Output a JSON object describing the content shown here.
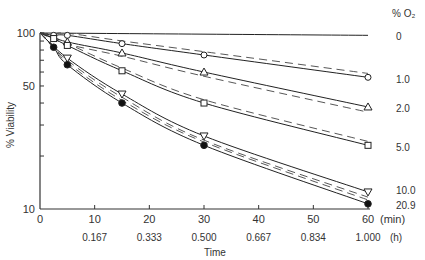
{
  "chart_data": {
    "type": "line",
    "title": "",
    "xlabel": "Time",
    "ylabel": "% Viability",
    "x_unit_primary": "(min)",
    "x_unit_secondary": "(h)",
    "xlim": [
      0,
      60
    ],
    "ylim": [
      10,
      100
    ],
    "yscale": "log",
    "x_ticks": [
      0,
      10,
      20,
      30,
      40,
      50,
      60
    ],
    "x_tick_labels": [
      "0",
      "10",
      "20",
      "30",
      "40",
      "50",
      "60"
    ],
    "x_tick_labels_hours": [
      "",
      "0.167",
      "0.333",
      "0.500",
      "0.667",
      "0.834",
      "1.000"
    ],
    "y_tick_labels": [
      {
        "value": 100,
        "label": "100"
      },
      {
        "value": 50,
        "label": "50"
      },
      {
        "value": 10,
        "label": "10"
      }
    ],
    "legend_title": "% O₂",
    "legend_position": "right",
    "grid": false,
    "series": [
      {
        "name": "0",
        "marker": "none",
        "x": [
          0,
          60
        ],
        "values": [
          100,
          97
        ],
        "fit": [
          [
            0,
            100
          ],
          [
            60,
            97
          ]
        ]
      },
      {
        "name": "1.0",
        "marker": "open-circle",
        "x": [
          2.5,
          5,
          15,
          30,
          60
        ],
        "values": [
          97,
          97,
          87,
          75,
          56
        ]
      },
      {
        "name": "2.0",
        "marker": "open-triangle",
        "x": [
          5,
          15,
          30,
          60
        ],
        "values": [
          89,
          77,
          60,
          38
        ]
      },
      {
        "name": "5.0",
        "marker": "open-square",
        "x": [
          2.5,
          5,
          15,
          30,
          60
        ],
        "values": [
          93,
          85,
          61,
          40,
          23
        ]
      },
      {
        "name": "10.0",
        "marker": "open-inverted-triangle",
        "x": [
          5,
          15,
          30,
          60
        ],
        "values": [
          72,
          45,
          26,
          12.5
        ]
      },
      {
        "name": "20.9",
        "marker": "filled-circle",
        "x": [
          2.5,
          5,
          15,
          30,
          60
        ],
        "values": [
          83,
          66,
          40,
          23,
          10.7
        ]
      }
    ]
  }
}
